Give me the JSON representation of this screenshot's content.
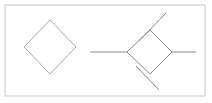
{
  "figure": {
    "width": 212,
    "height": 103,
    "background_color": "#ffffff"
  },
  "frame": {
    "label": "outer-border",
    "x": 5,
    "y": 5,
    "width": 200,
    "height": 91,
    "stroke_color": "#c8c8c8",
    "stroke_width": 1
  },
  "stroke_colors": {
    "primary": "#8a8a8a",
    "faint": "#a9a9a9"
  },
  "shapes": [
    {
      "name": "left-diamond",
      "type": "polygon",
      "stroke_color": "#a9a9a9",
      "points": "50,20 76,47 50,74 24,47",
      "center": {
        "x": 50,
        "y": 47
      },
      "half_width": 26,
      "half_height": 27
    },
    {
      "name": "right-diamond",
      "type": "polygon",
      "stroke_color": "#8a8a8a",
      "points": "150,30 172,52 150,74 127,52",
      "center": {
        "x": 150,
        "y": 52
      },
      "half_width": 22,
      "half_height": 22
    }
  ],
  "connectors": [
    {
      "name": "left-horizontal-connector",
      "type": "line",
      "stroke_color": "#8a8a8a",
      "x1": 90,
      "y1": 52,
      "x2": 127,
      "y2": 52
    },
    {
      "name": "right-horizontal-connector",
      "type": "line",
      "stroke_color": "#8a8a8a",
      "x1": 172,
      "y1": 52,
      "x2": 196,
      "y2": 52
    },
    {
      "name": "upper-right-diagonal-connector",
      "type": "line",
      "stroke_color": "#8a8a8a",
      "x1": 139,
      "y1": 41,
      "x2": 166,
      "y2": 13
    },
    {
      "name": "lower-right-diagonal-connector",
      "type": "line",
      "stroke_color": "#8a8a8a",
      "x1": 136,
      "y1": 66,
      "x2": 159,
      "y2": 90
    }
  ]
}
